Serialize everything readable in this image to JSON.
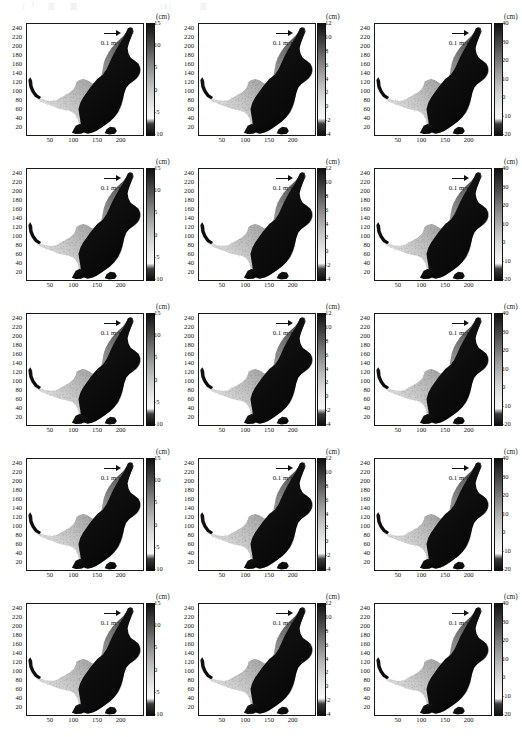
{
  "figure": {
    "header_remnant": "（Ⅰ）圆 图 （Ⅱ）（Ⅲ）",
    "rows": 5,
    "cols": 3,
    "axis": {
      "x_ticks": [
        "50",
        "100",
        "150",
        "200"
      ],
      "x_tick_values": [
        50,
        100,
        150,
        200
      ],
      "x_range": [
        0,
        245
      ],
      "y_ticks": [
        "240",
        "220",
        "200",
        "180",
        "160",
        "140",
        "120",
        "100",
        "80",
        "60",
        "40",
        "20"
      ],
      "y_tick_values": [
        240,
        220,
        200,
        180,
        160,
        140,
        120,
        100,
        80,
        60,
        40,
        20
      ],
      "y_range": [
        5,
        250
      ]
    },
    "vector_legend": {
      "label_main": "0.1 m",
      "label_unit": "·s",
      "label_exp": "-1",
      "full": "0.1 m·s",
      "arrow_icon": "right-arrow-icon"
    },
    "colorbars": [
      {
        "column": 0,
        "unit": "(cm)",
        "ticks": [
          "15",
          "10",
          "5",
          "0",
          "-5",
          "-10"
        ],
        "tick_values": [
          15,
          10,
          5,
          0,
          -5,
          -10
        ],
        "range": [
          -10,
          15
        ]
      },
      {
        "column": 1,
        "unit": "(cm)",
        "ticks": [
          "12",
          "10",
          "8",
          "6",
          "4",
          "2",
          "0",
          "-2",
          "-4"
        ],
        "tick_values": [
          12,
          10,
          8,
          6,
          4,
          2,
          0,
          -2,
          -4
        ],
        "range": [
          -4,
          12
        ]
      },
      {
        "column": 2,
        "unit": "(cm)",
        "ticks": [
          "40",
          "30",
          "20",
          "10",
          "0",
          "-10",
          "-20"
        ],
        "tick_values": [
          40,
          30,
          20,
          10,
          0,
          -10,
          -20
        ],
        "range": [
          -20,
          40
        ]
      }
    ]
  },
  "chart_data": {
    "type": "heatmap",
    "title": "",
    "subtitle": "",
    "xlabel": "",
    "ylabel": "",
    "grid": {
      "rows": 5,
      "cols": 3
    },
    "xlim": [
      0,
      245
    ],
    "ylim": [
      5,
      250
    ],
    "x_tick_labels": [
      "50",
      "100",
      "150",
      "200"
    ],
    "y_tick_labels": [
      "240",
      "220",
      "200",
      "180",
      "160",
      "140",
      "120",
      "100",
      "80",
      "60",
      "40",
      "20"
    ],
    "grid_on": false,
    "legend_position": "upper-right-inside",
    "vector_scale": "0.1 m·s-1",
    "panels": [
      {
        "row": 0,
        "col": 0,
        "cbar_unit": "(cm)",
        "cbar_ticks": [
          15,
          10,
          5,
          0,
          -5,
          -10
        ],
        "vmin": -10,
        "vmax": 15
      },
      {
        "row": 0,
        "col": 1,
        "cbar_unit": "(cm)",
        "cbar_ticks": [
          12,
          10,
          8,
          6,
          4,
          2,
          0,
          -2,
          -4
        ],
        "vmin": -4,
        "vmax": 12
      },
      {
        "row": 0,
        "col": 2,
        "cbar_unit": "(cm)",
        "cbar_ticks": [
          40,
          30,
          20,
          10,
          0,
          -10,
          -20
        ],
        "vmin": -20,
        "vmax": 40
      },
      {
        "row": 1,
        "col": 0,
        "cbar_unit": "(cm)",
        "cbar_ticks": [
          15,
          10,
          5,
          0,
          -5,
          -10
        ],
        "vmin": -10,
        "vmax": 15
      },
      {
        "row": 1,
        "col": 1,
        "cbar_unit": "(cm)",
        "cbar_ticks": [
          12,
          10,
          8,
          6,
          4,
          2,
          0,
          -2,
          -4
        ],
        "vmin": -4,
        "vmax": 12
      },
      {
        "row": 1,
        "col": 2,
        "cbar_unit": "(cm)",
        "cbar_ticks": [
          40,
          30,
          20,
          10,
          0,
          -10,
          -20
        ],
        "vmin": -20,
        "vmax": 40
      },
      {
        "row": 2,
        "col": 0,
        "cbar_unit": "(cm)",
        "cbar_ticks": [
          15,
          10,
          5,
          0,
          -5,
          -10
        ],
        "vmin": -10,
        "vmax": 15
      },
      {
        "row": 2,
        "col": 1,
        "cbar_unit": "(cm)",
        "cbar_ticks": [
          12,
          10,
          8,
          6,
          4,
          2,
          0,
          -2,
          -4
        ],
        "vmin": -4,
        "vmax": 12
      },
      {
        "row": 2,
        "col": 2,
        "cbar_unit": "(cm)",
        "cbar_ticks": [
          40,
          30,
          20,
          10,
          0,
          -10,
          -20
        ],
        "vmin": -20,
        "vmax": 40
      },
      {
        "row": 3,
        "col": 0,
        "cbar_unit": "(cm)",
        "cbar_ticks": [
          15,
          10,
          5,
          0,
          -5,
          -10
        ],
        "vmin": -10,
        "vmax": 15
      },
      {
        "row": 3,
        "col": 1,
        "cbar_unit": "(cm)",
        "cbar_ticks": [
          12,
          10,
          8,
          6,
          4,
          2,
          0,
          -2,
          -4
        ],
        "vmin": -4,
        "vmax": 12
      },
      {
        "row": 3,
        "col": 2,
        "cbar_unit": "(cm)",
        "cbar_ticks": [
          40,
          30,
          20,
          10,
          0,
          -10,
          -20
        ],
        "vmin": -20,
        "vmax": 40
      },
      {
        "row": 4,
        "col": 0,
        "cbar_unit": "(cm)",
        "cbar_ticks": [
          15,
          10,
          5,
          0,
          -5,
          -10
        ],
        "vmin": -10,
        "vmax": 15
      },
      {
        "row": 4,
        "col": 1,
        "cbar_unit": "(cm)",
        "cbar_ticks": [
          12,
          10,
          8,
          6,
          4,
          2,
          0,
          -2,
          -4
        ],
        "vmin": -4,
        "vmax": 12
      },
      {
        "row": 4,
        "col": 2,
        "cbar_unit": "(cm)",
        "cbar_ticks": [
          40,
          30,
          20,
          10,
          0,
          -10,
          -20
        ],
        "vmin": -20,
        "vmax": 40
      }
    ]
  }
}
